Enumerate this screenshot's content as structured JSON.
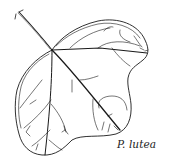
{
  "figure": {
    "caption": "P. lutea",
    "stroke_color": "#1a1a1a",
    "background": "#ffffff"
  }
}
